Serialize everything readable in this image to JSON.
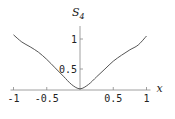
{
  "chart_data": {
    "type": "line",
    "title": "",
    "xlabel": "x",
    "ylabel": "S",
    "ylabel_subscript": "4",
    "xlim": [
      -1,
      1
    ],
    "ylim": [
      0.15,
      1.15
    ],
    "axis_crossing_y": 0.15,
    "grid": false,
    "legend": "none",
    "x_ticks": [
      -1,
      -0.5,
      0.5,
      1
    ],
    "x_tick_labels": [
      "-1",
      "-0.5",
      "0.5",
      "1"
    ],
    "y_ticks": [
      0.5,
      1
    ],
    "y_tick_labels": [
      "0.5",
      "1"
    ],
    "series": [
      {
        "name": "S4",
        "x": [
          -1,
          -0.875,
          -0.75,
          -0.625,
          -0.5,
          -0.375,
          -0.25,
          -0.125,
          0,
          0.125,
          0.25,
          0.375,
          0.5,
          0.625,
          0.75,
          0.875,
          1
        ],
        "y": [
          1.07,
          0.95,
          0.87,
          0.78,
          0.66,
          0.52,
          0.38,
          0.24,
          0.17,
          0.24,
          0.37,
          0.5,
          0.63,
          0.73,
          0.82,
          0.9,
          1.05
        ]
      }
    ]
  }
}
